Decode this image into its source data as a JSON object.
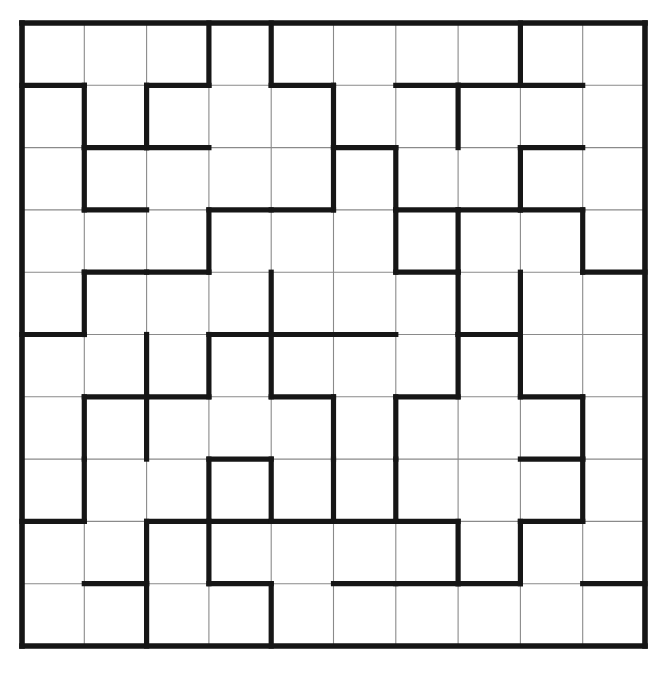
{
  "puzzle": {
    "title": "Grid Wall Puzzle",
    "type": "region-partition-grid",
    "rows": 10,
    "cols": 10,
    "origin_x": 22,
    "origin_y": 23,
    "cell_size": 62.3,
    "colors": {
      "background": "#ffffff",
      "cell_fill": "#ffffff",
      "thin_grid_line": "#8a8a8a",
      "thick_wall_line": "#161616",
      "border": "#161616"
    },
    "line_widths": {
      "thin": 1.1,
      "thick": 5.2,
      "border": 5.6
    },
    "cell_labels": [],
    "horizontal_walls": [
      {
        "row_boundary": 1,
        "cols": [
          1,
          3,
          5,
          7,
          8,
          9
        ]
      },
      {
        "row_boundary": 2,
        "cols": [
          2,
          3,
          6,
          9
        ]
      },
      {
        "row_boundary": 3,
        "cols": [
          2,
          4,
          5,
          7,
          8,
          9
        ]
      },
      {
        "row_boundary": 4,
        "cols": [
          2,
          3,
          7,
          10
        ]
      },
      {
        "row_boundary": 5,
        "cols": [
          1,
          4,
          5,
          6,
          8
        ]
      },
      {
        "row_boundary": 6,
        "cols": [
          2,
          3,
          5,
          7,
          9
        ]
      },
      {
        "row_boundary": 7,
        "cols": [
          4,
          9
        ]
      },
      {
        "row_boundary": 8,
        "cols": [
          1,
          3,
          4,
          5,
          6,
          7,
          9
        ]
      },
      {
        "row_boundary": 9,
        "cols": [
          2,
          4,
          6,
          7,
          8,
          10
        ]
      }
    ],
    "vertical_walls": [
      {
        "col_boundary": 1,
        "rows": [
          2,
          3,
          5,
          7,
          8
        ]
      },
      {
        "col_boundary": 2,
        "rows": [
          2,
          6,
          7,
          9,
          10
        ]
      },
      {
        "col_boundary": 3,
        "rows": [
          1,
          4,
          6,
          8,
          9
        ]
      },
      {
        "col_boundary": 4,
        "rows": [
          1,
          5,
          6,
          8,
          10
        ]
      },
      {
        "col_boundary": 5,
        "rows": [
          2,
          3,
          7,
          8
        ]
      },
      {
        "col_boundary": 6,
        "rows": [
          3,
          4,
          7,
          8
        ]
      },
      {
        "col_boundary": 7,
        "rows": [
          2,
          4,
          5,
          6,
          9
        ]
      },
      {
        "col_boundary": 8,
        "rows": [
          1,
          3,
          5,
          6,
          9
        ]
      },
      {
        "col_boundary": 9,
        "rows": [
          4,
          7,
          8
        ]
      }
    ]
  }
}
